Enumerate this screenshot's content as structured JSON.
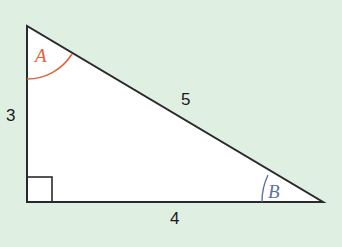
{
  "diagram": {
    "type": "right-triangle",
    "vertices": {
      "top": [
        27,
        26
      ],
      "right_angle": [
        27,
        202
      ],
      "right": [
        323,
        202
      ]
    },
    "sides": {
      "vertical": "3",
      "hypotenuse": "5",
      "horizontal": "4"
    },
    "angles": {
      "A": {
        "label": "A",
        "color": "#e0643a"
      },
      "B": {
        "label": "B",
        "color": "#5a72a8"
      }
    },
    "right_angle_marker": true,
    "colors": {
      "background": "#dff0e3",
      "fill": "#ffffff",
      "stroke": "#2a2a2a"
    }
  }
}
